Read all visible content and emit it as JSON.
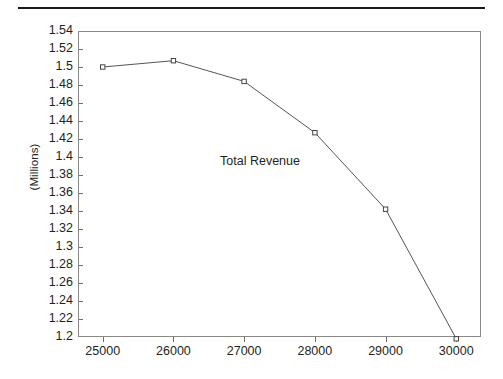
{
  "chart_data": {
    "type": "line",
    "title": "",
    "xlabel": "",
    "ylabel": "(Millions)",
    "annotation": "Total Revenue",
    "grid": false,
    "legend": "none",
    "xlim": [
      24650,
      30350
    ],
    "ylim": [
      1.2,
      1.54
    ],
    "x": [
      25000,
      26000,
      27000,
      28000,
      29000,
      30000
    ],
    "xtick_labels": [
      "25000",
      "26000",
      "27000",
      "28000",
      "29000",
      "30000"
    ],
    "ytick_values": [
      1.2,
      1.22,
      1.24,
      1.26,
      1.28,
      1.3,
      1.32,
      1.34,
      1.36,
      1.38,
      1.4,
      1.42,
      1.44,
      1.46,
      1.48,
      1.5,
      1.52,
      1.54
    ],
    "ytick_labels": [
      "1.2",
      "1.22",
      "1.24",
      "1.26",
      "1.28",
      "1.3",
      "1.32",
      "1.34",
      "1.36",
      "1.38",
      "1.4",
      "1.42",
      "1.44",
      "1.46",
      "1.48",
      "1.5",
      "1.52",
      "1.54"
    ],
    "series": [
      {
        "name": "Total Revenue",
        "values": [
          1.5,
          1.507,
          1.484,
          1.427,
          1.342,
          1.198
        ],
        "marker": "open-square",
        "line_color": "#555555",
        "marker_color": "#444444"
      }
    ]
  },
  "style": {
    "background": "#ffffff",
    "text_color": "#231f20",
    "frame_color": "#8a8a8a",
    "rule_color": "#1a1a1a"
  }
}
